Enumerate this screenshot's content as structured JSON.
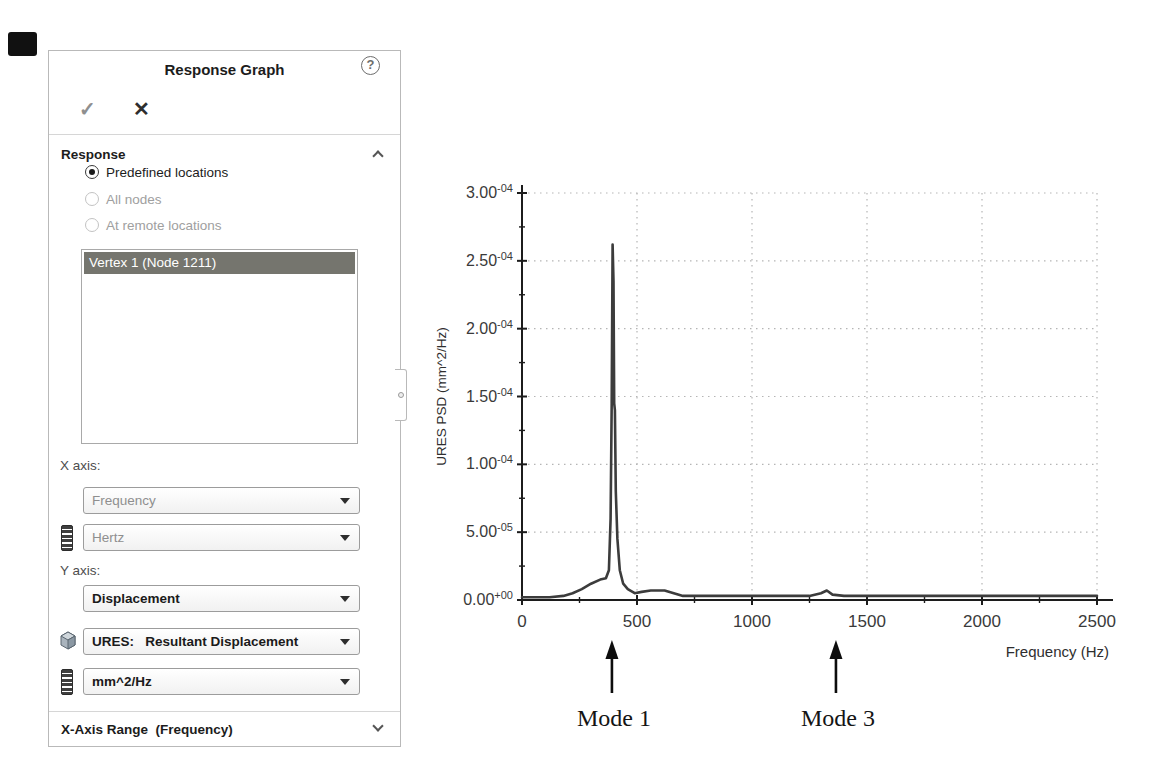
{
  "panel": {
    "title": "Response Graph",
    "help_glyph": "?",
    "ok_glyph": "✓",
    "cancel_glyph": "✕",
    "response": {
      "header": "Response",
      "options": [
        {
          "label": "Predefined locations",
          "selected": true,
          "enabled": true
        },
        {
          "label": "All nodes",
          "selected": false,
          "enabled": false
        },
        {
          "label": "At remote locations",
          "selected": false,
          "enabled": false
        }
      ],
      "locations": [
        {
          "label": "Vertex 1 (Node 1211)",
          "selected": true
        }
      ]
    },
    "x_axis": {
      "label": "X axis:",
      "quantity": "Frequency",
      "units": "Hertz"
    },
    "y_axis": {
      "label": "Y axis:",
      "quantity": "Displacement",
      "component": "URES:   Resultant Displacement",
      "units": "mm^2/Hz"
    },
    "footer": {
      "label": "X-Axis Range  (Frequency)"
    },
    "colors": {
      "selection": "#75756e"
    }
  },
  "chart_data": {
    "type": "line",
    "title": "",
    "xlabel": "Frequency (Hz)",
    "ylabel": "URES PSD (mm^2/Hz)",
    "xlim": [
      0,
      2500
    ],
    "ylim": [
      0,
      0.0003
    ],
    "grid": true,
    "legend": "none",
    "line_color": "#3c3c3c",
    "x_ticks": [
      0,
      500,
      1000,
      1500,
      2000,
      2500
    ],
    "x_minor_step": 250,
    "y_minor_step": 2.5e-05,
    "y_ticks": [
      {
        "value": 0.0,
        "mantissa": "0.00",
        "exponent": "+00"
      },
      {
        "value": 5e-05,
        "mantissa": "5.00",
        "exponent": "-05"
      },
      {
        "value": 0.0001,
        "mantissa": "1.00",
        "exponent": "-04"
      },
      {
        "value": 0.00015,
        "mantissa": "1.50",
        "exponent": "-04"
      },
      {
        "value": 0.0002,
        "mantissa": "2.00",
        "exponent": "-04"
      },
      {
        "value": 0.00025,
        "mantissa": "2.50",
        "exponent": "-04"
      },
      {
        "value": 0.0003,
        "mantissa": "3.00",
        "exponent": "-04"
      }
    ],
    "series": [
      {
        "name": "URES PSD",
        "points": [
          [
            0,
            2e-06
          ],
          [
            120,
            2e-06
          ],
          [
            180,
            3e-06
          ],
          [
            220,
            5e-06
          ],
          [
            260,
            8e-06
          ],
          [
            300,
            1.2e-05
          ],
          [
            340,
            1.5e-05
          ],
          [
            365,
            1.6e-05
          ],
          [
            378,
            2.2e-05
          ],
          [
            385,
            6e-05
          ],
          [
            390,
            0.000145
          ],
          [
            394,
            0.000262
          ],
          [
            398,
            0.000235
          ],
          [
            401,
            0.000145
          ],
          [
            404,
            0.00014
          ],
          [
            408,
            8e-05
          ],
          [
            415,
            4.5e-05
          ],
          [
            425,
            2.2e-05
          ],
          [
            440,
            1.2e-05
          ],
          [
            460,
            8e-06
          ],
          [
            490,
            5e-06
          ],
          [
            520,
            6e-06
          ],
          [
            560,
            7e-06
          ],
          [
            620,
            7e-06
          ],
          [
            660,
            5e-06
          ],
          [
            700,
            3e-06
          ],
          [
            800,
            3e-06
          ],
          [
            1000,
            3e-06
          ],
          [
            1250,
            3e-06
          ],
          [
            1300,
            5e-06
          ],
          [
            1325,
            7e-06
          ],
          [
            1350,
            4e-06
          ],
          [
            1400,
            3e-06
          ],
          [
            1600,
            3e-06
          ],
          [
            2000,
            3e-06
          ],
          [
            2500,
            3e-06
          ]
        ]
      }
    ],
    "annotations": [
      {
        "label": "Mode 1",
        "x_hz": 391
      },
      {
        "label": "Mode 3",
        "x_hz": 1365
      }
    ]
  }
}
